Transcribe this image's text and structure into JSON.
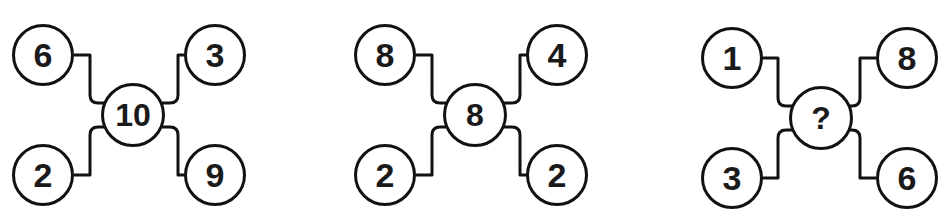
{
  "puzzle": {
    "description": "Number circle puzzle: three figures, each with a center circle connected to four outer circles",
    "figures": [
      {
        "id": 1,
        "top_left": "6",
        "top_right": "3",
        "bottom_left": "2",
        "bottom_right": "9",
        "center": "10"
      },
      {
        "id": 2,
        "top_left": "8",
        "top_right": "4",
        "bottom_left": "2",
        "bottom_right": "2",
        "center": "8"
      },
      {
        "id": 3,
        "top_left": "1",
        "top_right": "8",
        "bottom_left": "3",
        "bottom_right": "6",
        "center": "?"
      }
    ]
  },
  "colors": {
    "stroke": "#111111",
    "text": "#1a1a1a",
    "background": "#ffffff"
  }
}
